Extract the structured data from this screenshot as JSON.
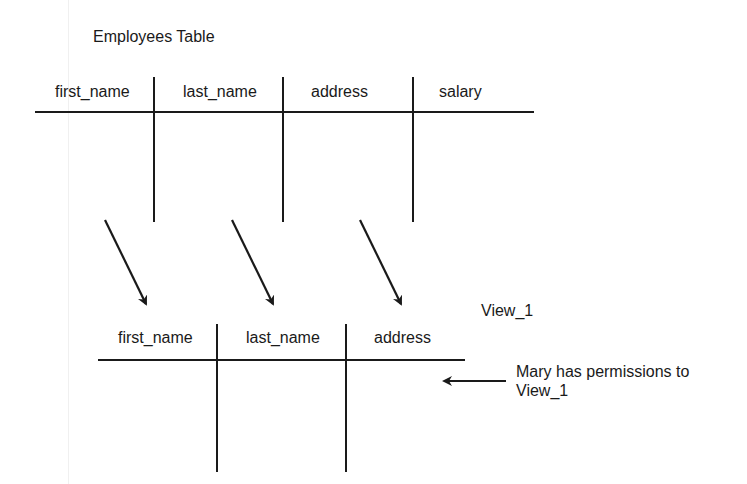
{
  "diagram": {
    "source_table": {
      "title": "Employees Table",
      "columns": [
        "first_name",
        "last_name",
        "address",
        "salary"
      ]
    },
    "view": {
      "title": "View_1",
      "columns": [
        "first_name",
        "last_name",
        "address"
      ]
    },
    "annotation": {
      "line1": "Mary has permissions to",
      "line2": "View_1"
    },
    "mappings": [
      {
        "from": "first_name",
        "to": "first_name"
      },
      {
        "from": "last_name",
        "to": "last_name"
      },
      {
        "from": "address",
        "to": "address"
      }
    ],
    "colors": {
      "ink": "#1a1a1a",
      "background": "#ffffff"
    }
  }
}
